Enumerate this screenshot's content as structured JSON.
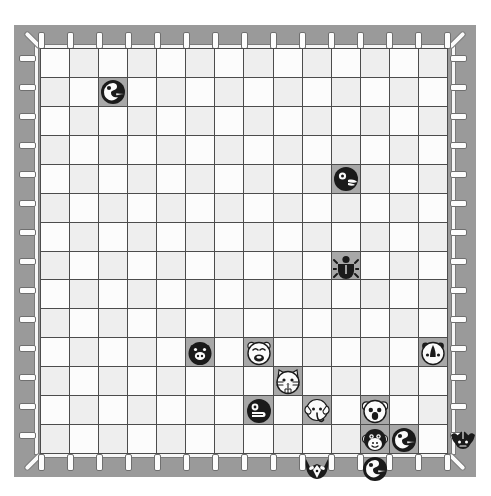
{
  "app": {
    "title": "Animal Board Game",
    "board_name": "animal-chess-board"
  },
  "board": {
    "columns": 14,
    "rows": 14,
    "cell_size_px": 29,
    "frame_color": "#9a9a9a",
    "grid_line_color": "#4c4c4c",
    "cell_light_color": "#fcfcfc",
    "cell_shade_color": "#eeeeee",
    "occupied_cell_color": "#a8a8a8",
    "tick_color": "#fdfdfd",
    "piece_dark_color": "#1a1a1a",
    "piece_light_color": "#fbfbfb",
    "top_ticks": 15,
    "bottom_ticks": 15,
    "left_ticks": 14,
    "right_ticks": 14
  },
  "pieces": [
    {
      "id": "p1",
      "name": "bird",
      "label": "Bird",
      "tone": "dark",
      "col": 3,
      "row": 2
    },
    {
      "id": "p2",
      "name": "fish",
      "label": "Fish",
      "tone": "dark",
      "col": 11,
      "row": 5
    },
    {
      "id": "p3",
      "name": "beetle",
      "label": "Beetle",
      "tone": "dark",
      "col": 11,
      "row": 8
    },
    {
      "id": "p4",
      "name": "pig",
      "label": "Pig",
      "tone": "dark",
      "col": 6,
      "row": 11
    },
    {
      "id": "p5",
      "name": "bear",
      "label": "Bear",
      "tone": "light",
      "col": 8,
      "row": 11
    },
    {
      "id": "p6",
      "name": "rhino",
      "label": "Rhino",
      "tone": "light",
      "col": 14,
      "row": 11
    },
    {
      "id": "p7",
      "name": "cat",
      "label": "Cat",
      "tone": "light",
      "col": 9,
      "row": 12
    },
    {
      "id": "p8",
      "name": "seal",
      "label": "Seal",
      "tone": "dark",
      "col": 8,
      "row": 13
    },
    {
      "id": "p9",
      "name": "elephant",
      "label": "Elephant",
      "tone": "light",
      "col": 10,
      "row": 13
    },
    {
      "id": "p10",
      "name": "koala",
      "label": "Koala",
      "tone": "light",
      "col": 12,
      "row": 13
    },
    {
      "id": "p11",
      "name": "monkey",
      "label": "Monkey",
      "tone": "light",
      "col": 12,
      "row": 14
    },
    {
      "id": "p12",
      "name": "bird2",
      "label": "Bird",
      "tone": "dark",
      "col": 13,
      "row": 14
    },
    {
      "id": "p13",
      "name": "bat",
      "label": "Bat",
      "tone": "dark",
      "col": 15,
      "row": 14
    },
    {
      "id": "p14",
      "name": "fox",
      "label": "Fox",
      "tone": "dark",
      "col": 10,
      "row": 15
    },
    {
      "id": "p15",
      "name": "bird3",
      "label": "Bird",
      "tone": "dark",
      "col": 12,
      "row": 15
    }
  ]
}
